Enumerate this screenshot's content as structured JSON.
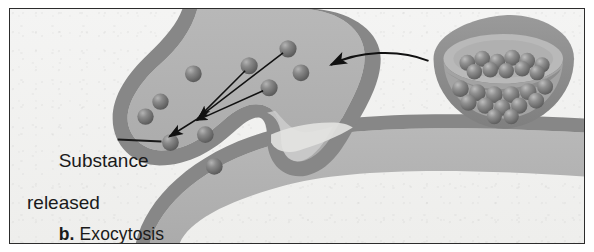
{
  "figure": {
    "panel_letter": "b.",
    "panel_title": "Exocytosis",
    "caption_full": "b. Exocytosis"
  },
  "labels": {
    "substance_released_line1": "Substance",
    "substance_released_line2": "released",
    "substance_released_full": "Substance released"
  },
  "icons": {
    "leader_line": "leader-line-icon",
    "release_arrows": "convergent-arrows-icon",
    "inset_arrow": "curved-arrow-icon"
  },
  "colors": {
    "background": "#f2f2f1",
    "frame": "#2c2c2c",
    "membrane_dark": "#8a8a8a",
    "cytoplasm": "#b3b3b3",
    "cytoplasm_light": "#c6c6c6",
    "granule": "#6d6d6d",
    "granule_highlight": "#a8a8a8",
    "text": "#1a1a1a",
    "arrow": "#111111"
  },
  "diagram": {
    "type": "biology-process-illustration",
    "process": "exocytosis",
    "structures": [
      {
        "name": "plasma-membrane",
        "description": "curved cell membrane band forming a fusion dome"
      },
      {
        "name": "secretory-vesicle-fusing",
        "description": "vesicle fused with membrane opening to exterior"
      },
      {
        "name": "fusion-pore",
        "description": "opening where vesicle contents exit the cell"
      },
      {
        "name": "secretory-vesicle-inset",
        "description": "cutaway vesicle filled with secretory granules"
      }
    ],
    "granules_inside_count": 6,
    "granules_released_count": 4,
    "inset_granules_count": 24,
    "release_arrow_count": 4
  }
}
